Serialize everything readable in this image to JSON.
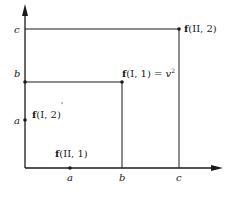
{
  "diagram": {
    "axis_labels": {
      "y_c": "c",
      "y_b": "b",
      "y_a": "a",
      "x_a": "a",
      "x_b": "b",
      "x_c": "c"
    },
    "points": {
      "f_II_2": {
        "bold": "f",
        "rest": "(II, 2)"
      },
      "f_I_1": {
        "bold": "f",
        "rest": "(I, 1) = ",
        "var": "v",
        "sup": "2"
      },
      "f_I_2": {
        "bold": "f",
        "rest": "(I, 2)"
      },
      "f_II_1": {
        "bold": "f",
        "rest": "(II, 1)"
      }
    },
    "colors": {
      "stroke": "#1a1a1a",
      "background": "#ffffff"
    }
  }
}
